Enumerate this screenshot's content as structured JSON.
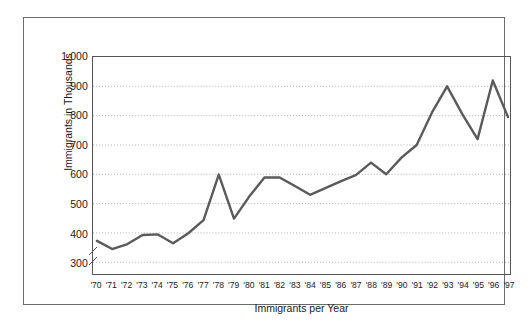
{
  "chart_data": {
    "type": "line",
    "title": "",
    "xlabel": "Immigrants per Year",
    "ylabel": "Immigrants in Thousands",
    "grid": "horizontal-dotted",
    "legend": "none",
    "axis_break": "y-axis break below 300",
    "ylim": [
      260,
      1000
    ],
    "yticks": [
      300,
      400,
      500,
      600,
      700,
      800,
      900,
      1000
    ],
    "ytick_labels": [
      "300",
      "400",
      "500",
      "600",
      "700",
      "800",
      "900",
      "1,000"
    ],
    "categories": [
      "'70",
      "'71",
      "'72",
      "'73",
      "'74",
      "'75",
      "'76",
      "'77",
      "'78",
      "'79",
      "'80",
      "'81",
      "'82",
      "'83",
      "'84",
      "'85",
      "'86",
      "'87",
      "'88",
      "'89",
      "'90",
      "'91",
      "'92",
      "'93",
      "'94",
      "'95",
      "'96",
      "'97"
    ],
    "values": [
      373,
      345,
      362,
      393,
      395,
      365,
      399,
      444,
      599,
      449,
      524,
      589,
      589,
      560,
      530,
      553,
      576,
      597,
      640,
      600,
      657,
      700,
      810,
      900,
      805,
      720,
      920,
      795
    ],
    "series": [
      {
        "name": "Immigrants",
        "color": "#5a5a5a",
        "values": [
          373,
          345,
          362,
          393,
          395,
          365,
          399,
          444,
          599,
          449,
          524,
          589,
          589,
          560,
          530,
          553,
          576,
          597,
          640,
          600,
          657,
          700,
          810,
          900,
          805,
          720,
          920,
          795
        ]
      }
    ]
  },
  "colors": {
    "line": "#5a5a5a",
    "grid": "#9a9a9a",
    "axis": "#555555",
    "frame": "#6b6b6b",
    "text": "#1a1a1a",
    "background": "#ffffff"
  }
}
